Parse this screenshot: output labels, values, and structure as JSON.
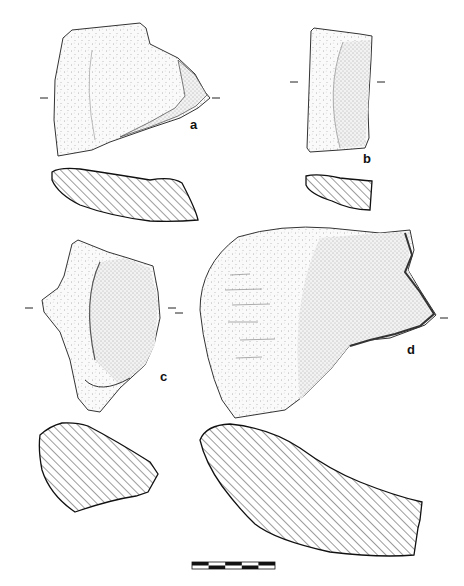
{
  "figure": {
    "kind": "archaeological artefact drawing plate",
    "background": "#ffffff",
    "ink_color": "#1a1a1a",
    "labels": [
      {
        "id": "a",
        "text": "a"
      },
      {
        "id": "b",
        "text": "b"
      },
      {
        "id": "c",
        "text": "c"
      },
      {
        "id": "d",
        "text": "d"
      }
    ],
    "artefacts": [
      {
        "id": "a",
        "view": "stippled face drawing with cross-section below",
        "section_hatch": "diagonal"
      },
      {
        "id": "b",
        "view": "stippled face drawing with cross-section below",
        "section_hatch": "diagonal"
      },
      {
        "id": "c",
        "view": "stippled face drawing with cross-section below",
        "section_hatch": "diagonal"
      },
      {
        "id": "d",
        "view": "stippled face drawing with cross-section below",
        "section_hatch": "diagonal"
      }
    ],
    "scale_bar": {
      "segments": 5,
      "pattern": "alternating black/white, two rows"
    }
  }
}
